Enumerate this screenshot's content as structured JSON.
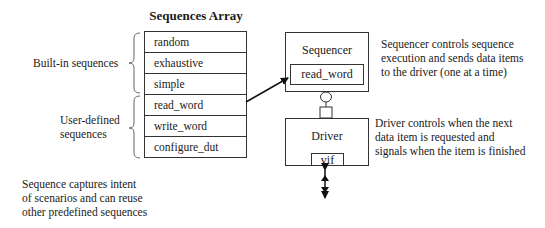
{
  "diagram": {
    "array_title": "Sequences Array",
    "sequences": [
      {
        "name": "random",
        "group": "built-in"
      },
      {
        "name": "exhaustive",
        "group": "built-in"
      },
      {
        "name": "simple",
        "group": "built-in"
      },
      {
        "name": "read_word",
        "group": "user-defined"
      },
      {
        "name": "write_word",
        "group": "user-defined"
      },
      {
        "name": "configure_dut",
        "group": "user-defined"
      }
    ],
    "groups": {
      "builtin_label": "Built-in sequences",
      "user_label_line1": "User-defined",
      "user_label_line2": "sequences"
    },
    "sequencer": {
      "title": "Sequencer",
      "current_sequence": "read_word",
      "description_lines": [
        "Sequencer controls sequence",
        "execution and sends data items",
        "to the driver (one at a time)"
      ]
    },
    "driver": {
      "title": "Driver",
      "interface": "vif",
      "description_lines": [
        "Driver controls when the next",
        "data item is requested and",
        "signals when the item is finished"
      ]
    },
    "sequence_note_lines": [
      "Sequence captures intent",
      "of scenarios and can reuse",
      "other predefined sequences"
    ],
    "colors": {
      "line": "#333333",
      "arrow": "#111111",
      "text": "#1a1a1a"
    }
  }
}
